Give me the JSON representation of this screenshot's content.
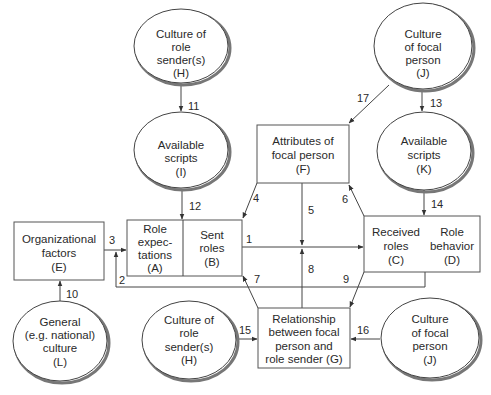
{
  "nodes": {
    "H_top": {
      "lines": [
        "Culture of",
        "role",
        "sender(s)",
        "(H)"
      ]
    },
    "I": {
      "lines": [
        "Available",
        "scripts",
        "(I)"
      ]
    },
    "J_top": {
      "lines": [
        "Culture",
        "of focal",
        "person",
        "(J)"
      ]
    },
    "K": {
      "lines": [
        "Available",
        "scripts",
        "(K)"
      ]
    },
    "F": {
      "lines": [
        "Attributes of",
        "focal person",
        "(F)"
      ]
    },
    "E": {
      "lines": [
        "Organizational",
        "factors",
        "(E)"
      ]
    },
    "A": {
      "lines": [
        "Role",
        "expec-",
        "tations",
        "(A)"
      ]
    },
    "B": {
      "lines": [
        "Sent",
        "roles",
        "(B)"
      ]
    },
    "C": {
      "lines": [
        "Received",
        "roles",
        "(C)"
      ]
    },
    "D": {
      "lines": [
        "Role",
        "behavior",
        "(D)"
      ]
    },
    "L": {
      "lines": [
        "General",
        "(e.g. national)",
        "culture",
        "(L)"
      ]
    },
    "H_bottom": {
      "lines": [
        "Culture of",
        "role",
        "sender(s)",
        "(H)"
      ]
    },
    "G": {
      "lines": [
        "Relationship",
        "between focal",
        "person and",
        "role sender (G)"
      ]
    },
    "J_bottom": {
      "lines": [
        "Culture",
        "of focal",
        "person",
        "(J)"
      ]
    }
  },
  "edges": {
    "e1": "1",
    "e2": "2",
    "e3": "3",
    "e4": "4",
    "e5": "5",
    "e6": "6",
    "e7": "7",
    "e8": "8",
    "e9": "9",
    "e10": "10",
    "e11": "11",
    "e12": "12",
    "e13": "13",
    "e14": "14",
    "e15": "15",
    "e16": "16",
    "e17": "17"
  },
  "colors": {
    "stroke": "#444444",
    "text": "#2a2a2a",
    "background": "#ffffff"
  }
}
